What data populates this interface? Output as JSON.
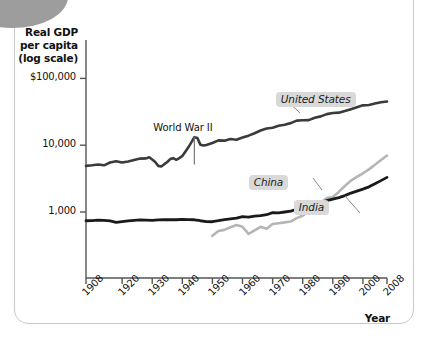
{
  "figure": {
    "y_axis_title": "Real GDP\nper capita\n(log scale)",
    "y_axis_title_lines": [
      "Real GDP",
      "per capita",
      "(log scale)"
    ],
    "x_axis_title": "Year"
  },
  "chart_data": {
    "type": "line",
    "title": "",
    "xlabel": "Year",
    "ylabel": "Real GDP per capita (log scale)",
    "yscale": "log",
    "ylim": [
      100,
      300000
    ],
    "xlim": [
      1908,
      2008
    ],
    "grid": false,
    "legend": "inline-labels",
    "ytick_labels": [
      "$100,000",
      "10,000",
      "1,000"
    ],
    "ytick_values": [
      100000,
      10000,
      1000
    ],
    "xtick_labels": [
      "1908",
      "1920",
      "1930",
      "1940",
      "1950",
      "1960",
      "1970",
      "1980",
      "1990",
      "2000",
      "2008"
    ],
    "xtick_values": [
      1908,
      1920,
      1930,
      1940,
      1950,
      1960,
      1970,
      1980,
      1990,
      2000,
      2008
    ],
    "annotations": [
      {
        "text": "World War II",
        "x": 1944,
        "y": 13500,
        "leader": true
      }
    ],
    "series": [
      {
        "name": "United States",
        "color": "#3b3b3b",
        "width": 2.6,
        "label_x": 1983,
        "label_y": 47000,
        "x": [
          1908,
          1910,
          1912,
          1914,
          1916,
          1918,
          1920,
          1922,
          1924,
          1926,
          1928,
          1929,
          1930,
          1931,
          1932,
          1933,
          1934,
          1935,
          1936,
          1937,
          1938,
          1939,
          1940,
          1941,
          1942,
          1943,
          1944,
          1945,
          1946,
          1947,
          1948,
          1950,
          1952,
          1954,
          1956,
          1958,
          1960,
          1962,
          1964,
          1966,
          1968,
          1970,
          1972,
          1974,
          1976,
          1978,
          1980,
          1982,
          1984,
          1986,
          1988,
          1990,
          1992,
          1994,
          1996,
          1998,
          2000,
          2002,
          2004,
          2006,
          2008
        ],
        "y": [
          4900,
          5000,
          5150,
          5000,
          5500,
          5750,
          5500,
          5700,
          6000,
          6300,
          6350,
          6600,
          6100,
          5600,
          4900,
          4800,
          5200,
          5600,
          6200,
          6400,
          6050,
          6400,
          6900,
          8000,
          9300,
          11000,
          13200,
          12800,
          10200,
          9900,
          10100,
          10800,
          11800,
          11700,
          12400,
          12100,
          13000,
          13900,
          15100,
          16600,
          17800,
          18200,
          19500,
          20300,
          21400,
          23300,
          23600,
          23700,
          25800,
          27000,
          29200,
          30400,
          30700,
          32500,
          34600,
          37000,
          39500,
          40000,
          42000,
          44000,
          45000
        ]
      },
      {
        "name": "China",
        "color": "#b5b5b5",
        "width": 2.6,
        "label_x": 1974,
        "label_y": 2700,
        "x": [
          1950,
          1952,
          1954,
          1956,
          1958,
          1960,
          1962,
          1964,
          1966,
          1968,
          1970,
          1972,
          1974,
          1976,
          1978,
          1980,
          1982,
          1984,
          1986,
          1988,
          1990,
          1992,
          1994,
          1996,
          1998,
          2000,
          2002,
          2004,
          2006,
          2008
        ],
        "y": [
          440,
          520,
          540,
          590,
          640,
          600,
          470,
          530,
          600,
          560,
          660,
          680,
          700,
          720,
          810,
          880,
          1000,
          1200,
          1380,
          1620,
          1680,
          2000,
          2450,
          2950,
          3350,
          3800,
          4350,
          5100,
          6000,
          7000
        ]
      },
      {
        "name": "India",
        "color": "#1a1a1a",
        "width": 2.8,
        "label_x": 1989,
        "label_y": 1150,
        "x": [
          1908,
          1910,
          1912,
          1914,
          1916,
          1918,
          1920,
          1922,
          1924,
          1926,
          1928,
          1930,
          1932,
          1934,
          1936,
          1938,
          1940,
          1942,
          1944,
          1946,
          1948,
          1950,
          1952,
          1954,
          1956,
          1958,
          1960,
          1962,
          1964,
          1966,
          1968,
          1970,
          1972,
          1974,
          1976,
          1978,
          1980,
          1982,
          1984,
          1986,
          1988,
          1990,
          1992,
          1994,
          1996,
          1998,
          2000,
          2002,
          2004,
          2006,
          2008
        ],
        "y": [
          740,
          745,
          755,
          750,
          735,
          700,
          720,
          735,
          750,
          760,
          755,
          750,
          760,
          765,
          770,
          765,
          775,
          770,
          765,
          740,
          720,
          715,
          740,
          770,
          790,
          810,
          850,
          840,
          870,
          880,
          910,
          980,
          970,
          1000,
          1030,
          1100,
          1120,
          1200,
          1290,
          1360,
          1480,
          1560,
          1640,
          1760,
          1920,
          2050,
          2200,
          2380,
          2650,
          2950,
          3300
        ]
      }
    ]
  }
}
